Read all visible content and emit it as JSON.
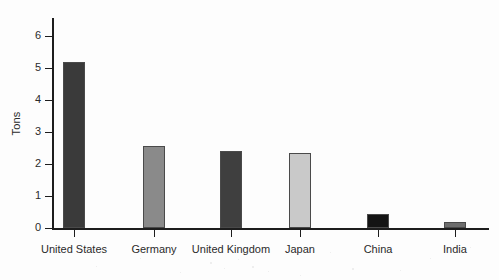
{
  "chart_data": {
    "type": "bar",
    "title": "",
    "xlabel": "",
    "ylabel": "Tons",
    "categories": [
      "United States",
      "Germany",
      "United Kingdom",
      "Japan",
      "China",
      "India"
    ],
    "values": [
      5.2,
      2.55,
      2.4,
      2.35,
      0.45,
      0.18
    ],
    "ylim": [
      0,
      6.4
    ],
    "yticks": [
      0,
      1,
      2,
      3,
      4,
      5,
      6
    ],
    "ytick_labels": [
      "0",
      "1",
      "2",
      "3",
      "4",
      "5",
      "6"
    ],
    "grid": false,
    "legend": "none",
    "bar_colors": [
      "#3a3a3a",
      "#8a8a8a",
      "#3f3f3f",
      "#c9c9c9",
      "#141414",
      "#6e6e6e"
    ]
  },
  "axis": {
    "y_title": "Tons"
  }
}
